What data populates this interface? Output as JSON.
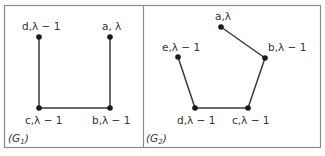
{
  "panels": [
    {
      "caption": "(G",
      "caption_sub": "1",
      "caption_close": ")",
      "nodes": [
        {
          "id": "d",
          "label": "d,λ − 1",
          "x": 39,
          "y": 37
        },
        {
          "id": "a",
          "label": "a, λ",
          "x": 110,
          "y": 37
        },
        {
          "id": "c",
          "label": "c,λ − 1",
          "x": 39,
          "y": 108
        },
        {
          "id": "b",
          "label": "b,λ − 1",
          "x": 110,
          "y": 108
        }
      ],
      "edges": [
        [
          "d",
          "c"
        ],
        [
          "c",
          "b"
        ],
        [
          "b",
          "a"
        ]
      ]
    },
    {
      "caption": "(G",
      "caption_sub": "2",
      "caption_close": ")",
      "nodes": [
        {
          "id": "a",
          "label": "a,λ",
          "x": 221,
          "y": 27
        },
        {
          "id": "b",
          "label": "b,λ − 1",
          "x": 265,
          "y": 58
        },
        {
          "id": "e",
          "label": "e,λ − 1",
          "x": 178,
          "y": 57
        },
        {
          "id": "d",
          "label": "d,λ − 1",
          "x": 195,
          "y": 108
        },
        {
          "id": "c",
          "label": "c,λ − 1",
          "x": 248,
          "y": 108
        }
      ],
      "edges": [
        [
          "a",
          "b"
        ],
        [
          "b",
          "c"
        ],
        [
          "c",
          "d"
        ],
        [
          "d",
          "e"
        ]
      ]
    }
  ]
}
